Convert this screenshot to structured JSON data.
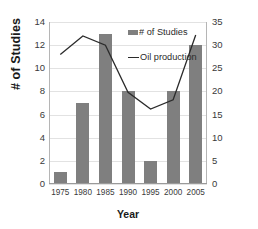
{
  "chart_data": {
    "type": "bar",
    "title": "",
    "xlabel": "Year",
    "ylabel": "# of Studies",
    "y2label": "Oil Production (million barrels/ year)",
    "categories": [
      "1975",
      "1980",
      "1985",
      "1990",
      "1995",
      "2000",
      "2005"
    ],
    "ylim": [
      0,
      14
    ],
    "y2lim": [
      0,
      35
    ],
    "yticks": [
      "14",
      "12",
      "10",
      "8",
      "6",
      "4",
      "2",
      "0"
    ],
    "y2ticks": [
      "35",
      "30",
      "25",
      "20",
      "15",
      "10",
      "5",
      "0"
    ],
    "grid": true,
    "legend_position": "inside-top-right",
    "series": [
      {
        "name": "# of Studies",
        "type": "bar",
        "axis": "left",
        "color": "#7f7f7f",
        "values": [
          1,
          7,
          13,
          8,
          2,
          8,
          12
        ]
      },
      {
        "name": "Oil production",
        "type": "line",
        "axis": "right",
        "color": "#2b2b2b",
        "values": [
          28,
          32,
          30,
          19.8,
          16.2,
          18.2,
          32.2
        ]
      }
    ]
  },
  "legend": {
    "items": [
      {
        "label": "# of Studies",
        "marker": "bar-swatch"
      },
      {
        "label": "Oil production",
        "marker": "line-swatch"
      }
    ]
  },
  "axes": {
    "left_title": "# of Studies",
    "right_title": "Oil Production (million barrels/ year)",
    "x_title": "Year"
  }
}
